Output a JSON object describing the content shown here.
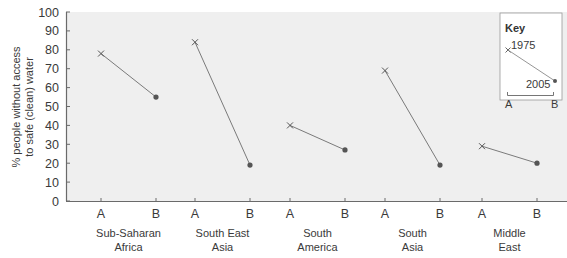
{
  "chart_data": {
    "type": "line",
    "title": "",
    "xlabel": "",
    "ylabel": "% people without access to safe (clean) water",
    "ylabel_lines": [
      "% people without access",
      "to safe (clean) water"
    ],
    "ylim": [
      0,
      100
    ],
    "yticks": [
      0,
      10,
      20,
      30,
      40,
      50,
      60,
      70,
      80,
      90,
      100
    ],
    "grid": false,
    "point_labels": [
      "A",
      "B"
    ],
    "series_meaning": {
      "A": "1975",
      "B": "2005"
    },
    "categories": [
      {
        "name": "Sub-Saharan Africa",
        "lines": [
          "Sub-Saharan",
          "Africa"
        ],
        "A": 78,
        "B": 55
      },
      {
        "name": "South East Asia",
        "lines": [
          "South East",
          "Asia"
        ],
        "A": 84,
        "B": 19
      },
      {
        "name": "South America",
        "lines": [
          "South",
          "America"
        ],
        "A": 40,
        "B": 27
      },
      {
        "name": "South Asia",
        "lines": [
          "South",
          "Asia"
        ],
        "A": 69,
        "B": 19
      },
      {
        "name": "Middle East",
        "lines": [
          "Middle",
          "East"
        ],
        "A": 29,
        "B": 20
      }
    ],
    "series": [
      {
        "name": "1975 (A)",
        "marker": "x",
        "values": [
          78,
          84,
          40,
          69,
          29
        ]
      },
      {
        "name": "2005 (B)",
        "marker": "dot",
        "values": [
          55,
          19,
          27,
          19,
          20
        ]
      }
    ],
    "legend": {
      "position": "top-right",
      "title": "Key",
      "start_label": "1975",
      "end_label": "2005",
      "axis_a": "A",
      "axis_b": "B"
    }
  },
  "colors": {
    "plot_bg": "#efefef",
    "axis": "#6a6a6a",
    "line": "#7a7a7a",
    "marker": "#555555",
    "text": "#3a3a3a"
  }
}
